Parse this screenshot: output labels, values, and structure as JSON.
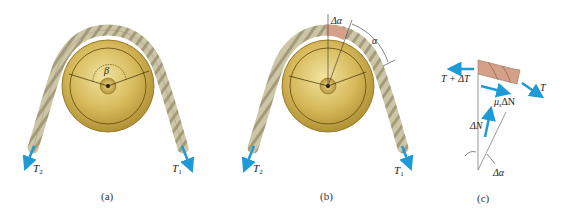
{
  "colors": {
    "background": "#ffffff",
    "pulley_light": "#e8d48a",
    "pulley_mid": "#c9a94a",
    "pulley_dark": "#8f6f1e",
    "rope": "#c8c0a0",
    "rope_dark": "#8e8668",
    "rope_element": "#d4a088",
    "arrow": "#1e9ad6",
    "line": "#444444"
  },
  "panels": [
    {
      "id": "a",
      "caption": "(a)",
      "angle_label": "β",
      "left_tension_label": "T",
      "left_tension_sub": "2",
      "right_tension_label": "T",
      "right_tension_sub": "1"
    },
    {
      "id": "b",
      "caption": "(b)",
      "delta_angle_label": "Δα",
      "angle_label": "α",
      "left_tension_label": "T",
      "left_tension_sub": "2",
      "right_tension_label": "T",
      "right_tension_sub": "1"
    },
    {
      "id": "c",
      "caption": "(c)",
      "left_force_label": "T + ΔT",
      "right_force_label": "T",
      "friction_label_mu": "μ",
      "friction_label_sub": "s",
      "friction_label_rest": "ΔN",
      "normal_label": "ΔN",
      "angle_label": "Δα"
    }
  ]
}
